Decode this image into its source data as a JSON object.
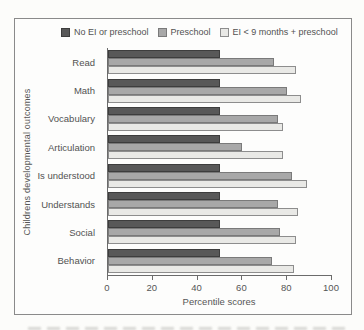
{
  "figure": {
    "background": "#fcfcfa",
    "panel_border_color": "#8a8a8a",
    "axis_color": "#6b6b6b",
    "text_color": "#525252"
  },
  "chart_data": {
    "type": "bar",
    "orientation": "horizontal",
    "title": "",
    "xlabel": "Percentile scores",
    "ylabel": "Childrens developmental outcomes",
    "xlim": [
      0,
      100
    ],
    "xticks": [
      0,
      20,
      40,
      60,
      80,
      100
    ],
    "grid": false,
    "legend_position": "top",
    "categories": [
      "Read",
      "Math",
      "Vocabulary",
      "Articulation",
      "Is understood",
      "Understands",
      "Social",
      "Behavior"
    ],
    "series": [
      {
        "name": "No EI or preschool",
        "color": "#585858",
        "border_color": "#3d3d3d",
        "values": [
          50,
          50,
          50,
          50,
          50,
          50,
          50,
          50
        ]
      },
      {
        "name": "Preschool",
        "color": "#a8a8a8",
        "border_color": "#7a7a7a",
        "values": [
          74,
          80,
          76,
          60,
          82,
          76,
          77,
          73
        ]
      },
      {
        "name": "EI < 9 months + preschool",
        "color": "#e9e9e6",
        "border_color": "#8d8d8d",
        "values": [
          84,
          86,
          78,
          78,
          89,
          85,
          84,
          83
        ]
      }
    ]
  }
}
